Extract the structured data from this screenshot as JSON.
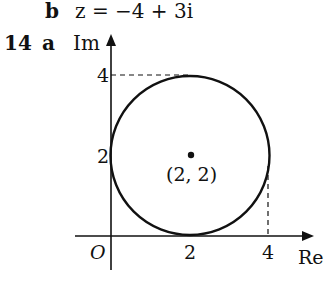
{
  "part_b": {
    "label": "b",
    "expression": "z = −4 + 3i"
  },
  "question": {
    "number": "14",
    "part": "a"
  },
  "diagram": {
    "im_axis_label": "Im",
    "re_axis_label": "Re",
    "origin_label": "O",
    "y_ticks": [
      "4",
      "2"
    ],
    "x_ticks": [
      "2",
      "4"
    ],
    "center_label": "(2, 2)",
    "circle": {
      "center": [
        2,
        2
      ],
      "radius": 2
    },
    "stroke_color": "#111111"
  }
}
